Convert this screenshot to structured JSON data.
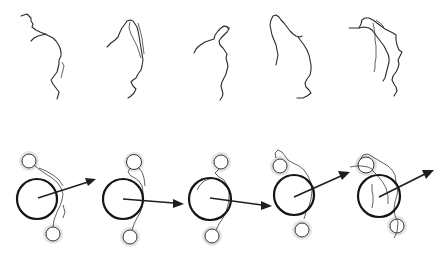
{
  "figure": {
    "type": "diagram",
    "colors": {
      "background": "#ffffff",
      "stroke": "#1e1e1e",
      "halo": "#d9d9d9"
    },
    "top_row": {
      "panel_count": 5,
      "panels": [
        {
          "index": 1,
          "center_x": 42
        },
        {
          "index": 2,
          "center_x": 127
        },
        {
          "index": 3,
          "center_x": 213
        },
        {
          "index": 4,
          "center_x": 293
        },
        {
          "index": 5,
          "center_x": 377
        }
      ]
    },
    "bottom_row": {
      "panel_count": 5,
      "panels": [
        {
          "index": 1,
          "circle": {
            "cx": 37,
            "cy": 199,
            "r": 20
          },
          "arrow": {
            "x1": 38,
            "y1": 198,
            "x2": 95,
            "y2": 179
          },
          "halos": [
            {
              "cx": 29,
              "cy": 161,
              "r": 9
            },
            {
              "cx": 53,
              "cy": 233,
              "r": 9
            }
          ]
        },
        {
          "index": 2,
          "circle": {
            "cx": 123,
            "cy": 199,
            "r": 20
          },
          "arrow": {
            "x1": 123,
            "y1": 199,
            "x2": 183,
            "y2": 204
          },
          "halos": [
            {
              "cx": 134,
              "cy": 161,
              "r": 9
            },
            {
              "cx": 130,
              "cy": 237,
              "r": 9
            }
          ]
        },
        {
          "index": 3,
          "circle": {
            "cx": 210,
            "cy": 199,
            "r": 21
          },
          "arrow": {
            "x1": 210,
            "y1": 198,
            "x2": 271,
            "y2": 206
          },
          "halos": [
            {
              "cx": 220,
              "cy": 162,
              "r": 9
            },
            {
              "cx": 212,
              "cy": 236,
              "r": 9
            }
          ]
        },
        {
          "index": 4,
          "circle": {
            "cx": 294,
            "cy": 195,
            "r": 20
          },
          "arrow": {
            "x1": 294,
            "y1": 197,
            "x2": 349,
            "y2": 173
          },
          "halos": [
            {
              "cx": 279,
              "cy": 165,
              "r": 9
            },
            {
              "cx": 302,
              "cy": 230,
              "r": 9
            }
          ]
        },
        {
          "index": 5,
          "circle": {
            "cx": 379,
            "cy": 196,
            "r": 21
          },
          "arrow": {
            "x1": 379,
            "y1": 197,
            "x2": 433,
            "y2": 170
          },
          "halos": [
            {
              "cx": 366,
              "cy": 164,
              "r": 10
            },
            {
              "cx": 397,
              "cy": 226,
              "r": 9
            }
          ]
        }
      ]
    }
  }
}
